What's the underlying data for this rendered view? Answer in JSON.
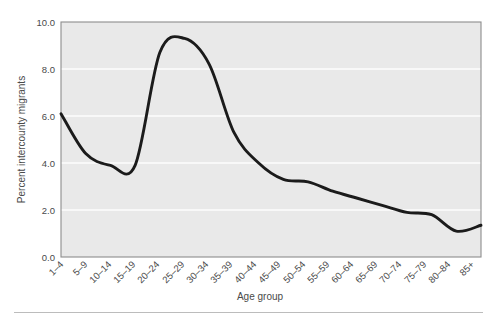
{
  "figure": {
    "background_color": "#ffffff",
    "plot_background_color": "#e9e9e9",
    "gridline_color": "#fdfdfd",
    "frame_color": "#8d8d8d",
    "line_color": "#1b1b1b",
    "footer_rule_color": "#bcbcbc"
  },
  "chart_data": {
    "type": "line",
    "title": "",
    "subtitle": "",
    "xlabel": "Age group",
    "ylabel": "Percent intercounty migrants",
    "categories": [
      "1–4",
      "5–9",
      "10–14",
      "15–19",
      "20–24",
      "25–29",
      "30–34",
      "35–39",
      "40–44",
      "45–49",
      "50–54",
      "55–59",
      "60–64",
      "65–69",
      "70–74",
      "75–79",
      "80–84",
      "85+"
    ],
    "values": [
      6.1,
      4.4,
      3.9,
      3.9,
      8.7,
      9.3,
      8.2,
      5.3,
      4.0,
      3.3,
      3.2,
      2.8,
      2.5,
      2.2,
      1.9,
      1.8,
      1.1,
      1.35
    ],
    "ylim": [
      0.0,
      10.0
    ],
    "yticks": [
      0.0,
      2.0,
      4.0,
      6.0,
      8.0,
      10.0
    ],
    "ytick_labels": [
      "0.0",
      "2.0",
      "4.0",
      "6.0",
      "8.0",
      "10.0"
    ],
    "grid": true,
    "grid_axis": "y",
    "legend": null,
    "legend_position": "none",
    "series": [
      {
        "name": "Percent intercounty migrants",
        "values": [
          6.1,
          4.4,
          3.9,
          3.9,
          8.7,
          9.3,
          8.2,
          5.3,
          4.0,
          3.3,
          3.2,
          2.8,
          2.5,
          2.2,
          1.9,
          1.8,
          1.1,
          1.35
        ]
      }
    ],
    "annotations": []
  }
}
